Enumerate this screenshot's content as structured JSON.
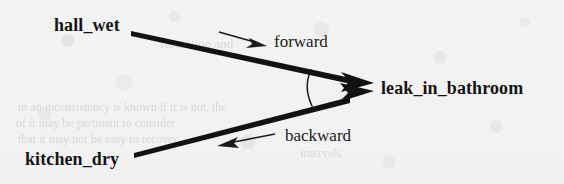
{
  "figure": {
    "type": "diagram",
    "background_color": "#f3f3f3",
    "ink_color": "#121212"
  },
  "nodes": [
    {
      "id": "hall_wet",
      "label": "hall_wet",
      "x": 54,
      "y": 15
    },
    {
      "id": "kitchen_dry",
      "label": "kitchen_dry",
      "x": 25,
      "y": 149
    },
    {
      "id": "leak_in_bathroom",
      "label": "leak_in_bathroom",
      "x": 381,
      "y": 78
    }
  ],
  "edges": [
    {
      "id": "forward-edge",
      "from": "hall_wet",
      "to": "leak_in_bathroom",
      "direction_label": "forward",
      "label_x": 274,
      "label_y": 32
    },
    {
      "id": "backward-edge",
      "from": "kitchen_dry",
      "to": "leak_in_bathroom",
      "direction_label": "backward",
      "label_x": 285,
      "label_y": 126
    }
  ],
  "annotations": {
    "angle_arc": "angle-arc-marker",
    "forward_hint_arrow": "forward-direction-arrow",
    "backward_hint_arrow": "backward-direction-arrow"
  },
  "ghost_text": [
    {
      "text": "formation  and",
      "x": 160,
      "y": 36,
      "size": 13
    },
    {
      "text": "in an inconsistency is known if it is not, the",
      "x": 18,
      "y": 100,
      "size": 12
    },
    {
      "text": "of  it   may   be   pertinent   to  consider",
      "x": 16,
      "y": 116,
      "size": 12
    },
    {
      "text": "that  it   may  not  be  easy  to  recover",
      "x": 18,
      "y": 132,
      "size": 12
    },
    {
      "text": "intervals",
      "x": 300,
      "y": 146,
      "size": 12
    }
  ]
}
